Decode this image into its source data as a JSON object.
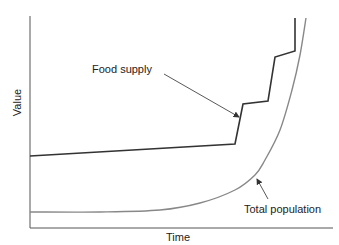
{
  "chart_data": {
    "type": "line",
    "title": "",
    "xlabel": "Time",
    "ylabel": "Value",
    "grid": false,
    "legend": "none (direct annotations with arrows)",
    "x_ticks": [],
    "y_ticks": [],
    "annotations": [
      {
        "text": "Food supply",
        "points_to": "Food supply"
      },
      {
        "text": "Total population",
        "points_to": "Total population"
      }
    ],
    "series": [
      {
        "name": "Food supply",
        "style": "stepwise linear increases",
        "color": "#333333",
        "points_px": [
          [
            30,
            156
          ],
          [
            235,
            144
          ],
          [
            243,
            104
          ],
          [
            268,
            101
          ],
          [
            275,
            57
          ],
          [
            295,
            51
          ],
          [
            295,
            18
          ]
        ]
      },
      {
        "name": "Total population",
        "style": "exponential growth",
        "color": "#888888",
        "points_px": [
          [
            30,
            212
          ],
          [
            100,
            212
          ],
          [
            160,
            210
          ],
          [
            200,
            203
          ],
          [
            235,
            190
          ],
          [
            255,
            175
          ],
          [
            265,
            160
          ],
          [
            280,
            130
          ],
          [
            292,
            90
          ],
          [
            300,
            55
          ],
          [
            306,
            18
          ]
        ]
      }
    ]
  },
  "labels": {
    "xlabel": "Time",
    "ylabel": "Value",
    "food": "Food supply",
    "population": "Total population"
  },
  "colors": {
    "axis": "#555555",
    "food": "#333333",
    "population": "#888888",
    "arrow": "#444444"
  }
}
